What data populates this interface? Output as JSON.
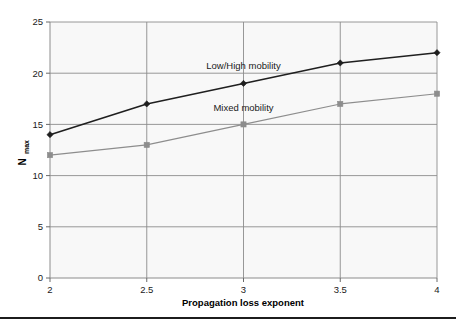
{
  "chart_data": {
    "type": "line",
    "title": "",
    "subtitle": "",
    "xlabel": "Propagation loss exponent",
    "ylabel": "Nmax",
    "ylabel_base": "N",
    "ylabel_subscript": "max",
    "x": [
      2,
      2.5,
      3,
      3.5,
      4
    ],
    "xtick_labels": [
      "2",
      "2.5",
      "3",
      "3.5",
      "4"
    ],
    "ytick_labels": [
      "0",
      "5",
      "10",
      "15",
      "20",
      "25"
    ],
    "yticks": [
      0,
      5,
      10,
      15,
      20,
      25
    ],
    "xlim": [
      2,
      4
    ],
    "ylim": [
      0,
      25
    ],
    "grid": "both",
    "legend_position": "inline-annotations",
    "series": [
      {
        "name": "Low/High mobility",
        "values": [
          14,
          17,
          19,
          21,
          22
        ],
        "color": "#1f1f1f",
        "marker": "diamond",
        "line_width": 1.6,
        "annotation": "Low/High mobility",
        "annotation_x": 3.0,
        "annotation_y": 20.4
      },
      {
        "name": "Mixed mobility",
        "values": [
          12,
          13,
          15,
          17,
          18
        ],
        "color": "#8d8d8d",
        "marker": "square",
        "line_width": 1.1,
        "annotation": "Mixed mobility",
        "annotation_x": 3.0,
        "annotation_y": 16.3
      }
    ],
    "colors": {
      "plot_background": "#f8f8f8",
      "grid": "#8c8c8c",
      "axis": "#8c8c8c",
      "text": "#1a1a1a",
      "series_dark": "#1f1f1f",
      "series_light": "#8d8d8d",
      "page_background": "#ffffff",
      "bottom_rule": "#1c1c1c"
    }
  }
}
